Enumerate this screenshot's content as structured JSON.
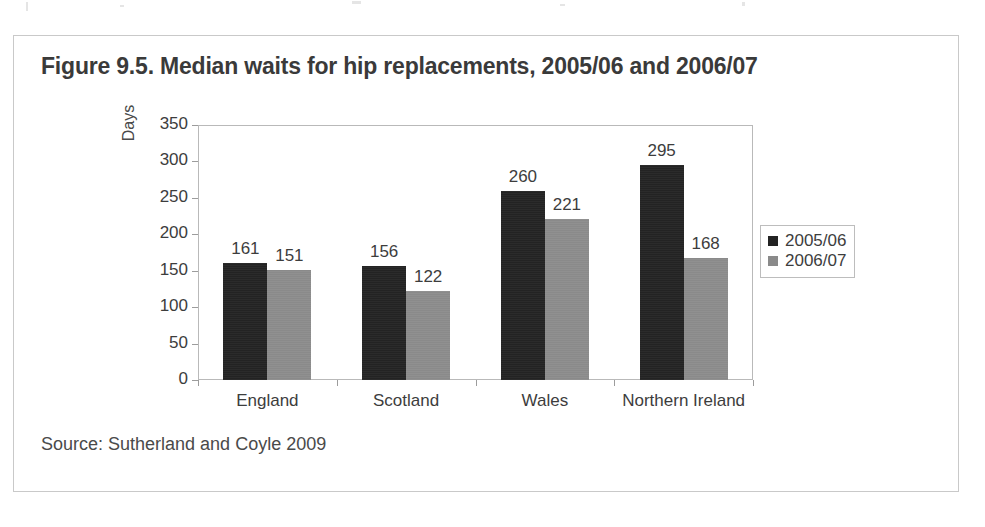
{
  "figure": {
    "title": "Figure 9.5. Median waits for hip replacements, 2005/06 and 2006/07",
    "source": "Source: Sutherland and Coyle 2009"
  },
  "chart_data": {
    "type": "bar",
    "title": "Figure 9.5. Median waits for hip replacements, 2005/06 and 2006/07",
    "xlabel": "",
    "ylabel": "Days",
    "categories": [
      "England",
      "Scotland",
      "Wales",
      "Northern Ireland"
    ],
    "series": [
      {
        "name": "2005/06",
        "color": "#232323",
        "values": [
          161,
          156,
          260,
          295
        ]
      },
      {
        "name": "2006/07",
        "color": "#8a8a8a",
        "values": [
          151,
          122,
          221,
          168
        ]
      }
    ],
    "ylim": [
      0,
      350
    ],
    "yticks": [
      0,
      50,
      100,
      150,
      200,
      250,
      300,
      350
    ],
    "ytick_labels": [
      "0",
      "50",
      "100",
      "150",
      "200",
      "250",
      "300",
      "350"
    ],
    "grid": false,
    "data_labels": true,
    "legend_position": "right"
  },
  "legend": {
    "entries": [
      {
        "label": "2005/06"
      },
      {
        "label": "2006/07"
      }
    ]
  }
}
